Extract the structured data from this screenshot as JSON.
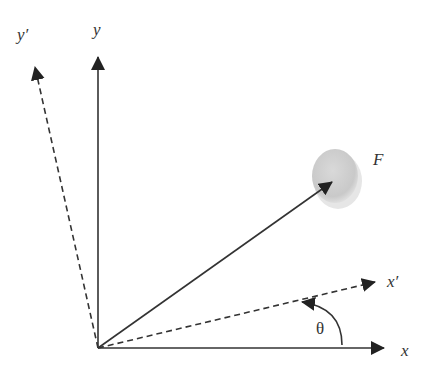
{
  "diagram": {
    "labels": {
      "y_prime": "y′",
      "y": "y",
      "x_prime": "x′",
      "x": "x",
      "force": "F",
      "angle": "θ"
    },
    "origin": [
      98,
      348
    ],
    "axes": [
      {
        "name": "x",
        "style": "solid",
        "tip": [
          385,
          348
        ]
      },
      {
        "name": "y",
        "style": "solid",
        "tip": [
          98,
          55
        ]
      },
      {
        "name": "x_prime",
        "style": "dashed",
        "tip": [
          376,
          282
        ]
      },
      {
        "name": "y_prime",
        "style": "dashed",
        "tip": [
          34,
          65
        ]
      }
    ],
    "force_vector": {
      "tip": [
        333,
        181
      ],
      "ball_center": [
        336,
        177
      ],
      "ball_rx": 24,
      "ball_ry": 28
    },
    "angle_arc": {
      "from": "x",
      "to": "x_prime",
      "direction": "counterclockwise"
    },
    "colors": {
      "line": "#333333",
      "ball": "#cfcfcf",
      "ball_shadow": "#e3e3e3"
    }
  }
}
